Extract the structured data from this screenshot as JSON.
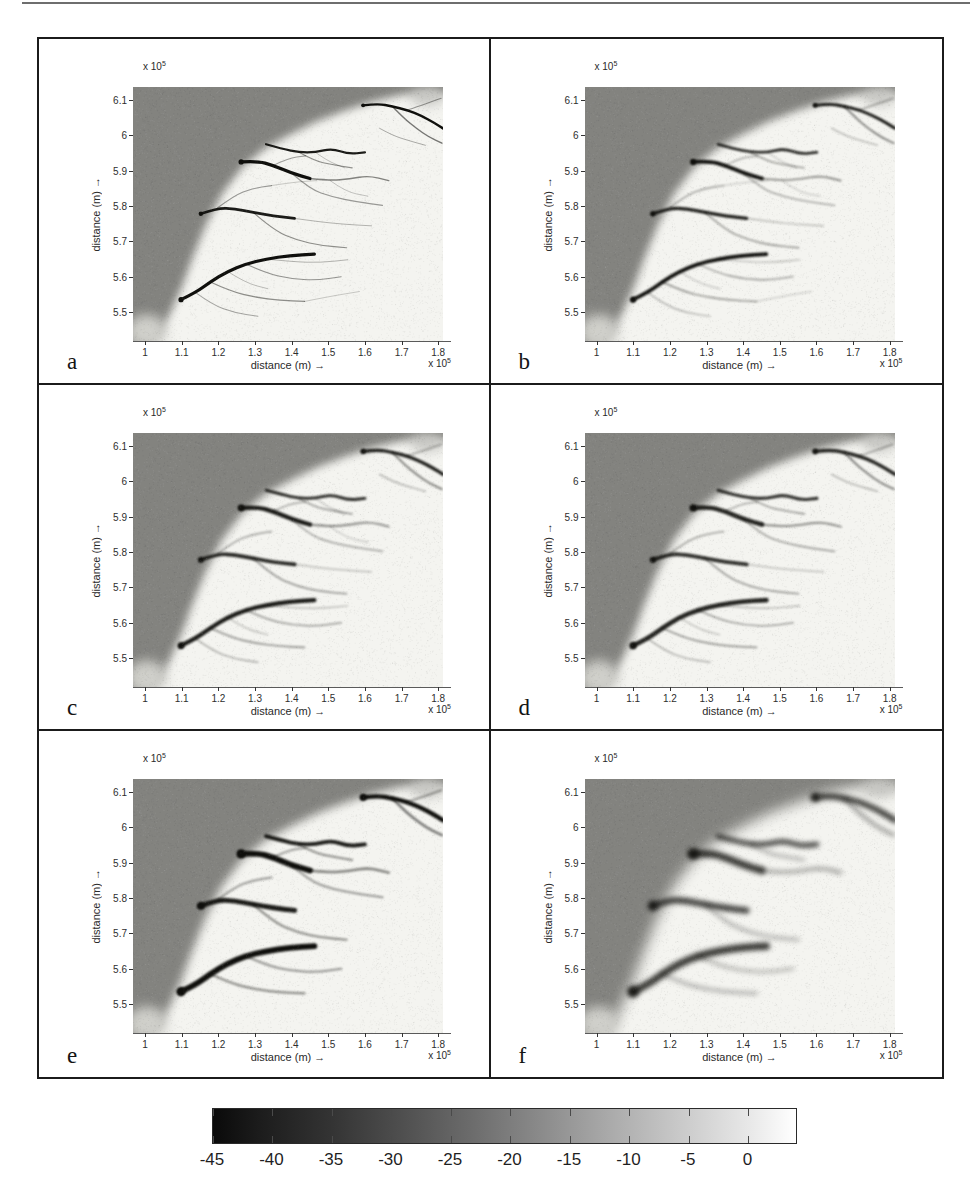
{
  "page": {
    "background": "#ffffff",
    "scan_top_line_color": "#6e6e6e"
  },
  "figure": {
    "border_color": "#1b1b1b",
    "panel_letters": [
      "a",
      "b",
      "c",
      "d",
      "e",
      "f"
    ]
  },
  "chart_data": {
    "type": "heatmap",
    "title": "",
    "grid": "3 rows x 2 columns",
    "x_axis": {
      "label": "distance (m) →",
      "exponent_base": "x 10",
      "exponent": "5",
      "tick_labels": [
        "1",
        "1.1",
        "1.2",
        "1.3",
        "1.4",
        "1.5",
        "1.6",
        "1.7",
        "1.8"
      ],
      "tick_values": [
        1,
        1.1,
        1.2,
        1.3,
        1.4,
        1.5,
        1.6,
        1.7,
        1.8
      ],
      "range": [
        0.967,
        1.813
      ]
    },
    "y_axis": {
      "label": "distance (m) →",
      "exponent_base": "x 10",
      "exponent": "5",
      "tick_labels": [
        "5.5",
        "5.6",
        "5.7",
        "5.8",
        "5.9",
        "6",
        "6.1"
      ],
      "tick_values": [
        5.5,
        5.6,
        5.7,
        5.8,
        5.9,
        6,
        6.1
      ],
      "range": [
        5.418,
        6.137
      ]
    },
    "colorbar": {
      "tick_labels": [
        "-45",
        "-40",
        "-35",
        "-30",
        "-25",
        "-20",
        "-15",
        "-10",
        "-5",
        "0"
      ],
      "tick_values": [
        -45,
        -40,
        -35,
        -30,
        -25,
        -20,
        -15,
        -10,
        -5,
        0
      ],
      "value_range": [
        -45,
        4
      ],
      "colormap": "gray (dark = deep)"
    },
    "sea_color": "#83837f",
    "flat_color": "#f4f4f0",
    "shoal_color": "#cfcfca",
    "channel_color": [
      15,
      15,
      12
    ],
    "panels": [
      {
        "label": "a",
        "blur": 0.6,
        "width_scale": 0.95,
        "alpha_scale": 1.0,
        "min_intensity": 0,
        "sea_blur": 4
      },
      {
        "label": "b",
        "blur": 0.8,
        "width_scale": 1.1,
        "alpha_scale": 1.0,
        "min_intensity": 0.22,
        "sea_blur": 4
      },
      {
        "label": "c",
        "blur": 0.9,
        "width_scale": 1.25,
        "alpha_scale": 0.95,
        "min_intensity": 0.26,
        "sea_blur": 4
      },
      {
        "label": "d",
        "blur": 1.3,
        "width_scale": 1.35,
        "alpha_scale": 0.9,
        "min_intensity": 0.3,
        "sea_blur": 4
      },
      {
        "label": "e",
        "blur": 1.0,
        "width_scale": 1.7,
        "alpha_scale": 1.0,
        "min_intensity": 0.38,
        "sea_blur": 5
      },
      {
        "label": "f",
        "blur": 2.4,
        "width_scale": 2.1,
        "alpha_scale": 0.85,
        "min_intensity": 0.42,
        "sea_blur": 7
      }
    ],
    "sea_boundary": [
      [
        0.9,
        5.39
      ],
      [
        0.967,
        5.395
      ],
      [
        1.005,
        5.405
      ],
      [
        1.04,
        5.44
      ],
      [
        1.07,
        5.5
      ],
      [
        1.1,
        5.57
      ],
      [
        1.13,
        5.655
      ],
      [
        1.165,
        5.745
      ],
      [
        1.21,
        5.835
      ],
      [
        1.265,
        5.91
      ],
      [
        1.33,
        5.965
      ],
      [
        1.4,
        6.005
      ],
      [
        1.47,
        6.04
      ],
      [
        1.545,
        6.07
      ],
      [
        1.62,
        6.095
      ],
      [
        1.7,
        6.115
      ],
      [
        1.78,
        6.12
      ],
      [
        1.813,
        6.115
      ],
      [
        1.9,
        6.12
      ],
      [
        1.9,
        6.25
      ],
      [
        0.9,
        6.25
      ]
    ],
    "channels": [
      {
        "pts": [
          [
            1.595,
            6.085
          ],
          [
            1.635,
            6.09
          ],
          [
            1.675,
            6.082
          ],
          [
            1.715,
            6.072
          ],
          [
            1.755,
            6.055
          ],
          [
            1.79,
            6.035
          ],
          [
            1.813,
            6.02
          ]
        ],
        "w": 2.6,
        "k": 1.0
      },
      {
        "pts": [
          [
            1.675,
            6.082
          ],
          [
            1.705,
            6.05
          ],
          [
            1.74,
            6.02
          ],
          [
            1.775,
            5.995
          ],
          [
            1.81,
            5.978
          ]
        ],
        "w": 1.5,
        "k": 0.55
      },
      {
        "pts": [
          [
            1.715,
            6.072
          ],
          [
            1.745,
            6.082
          ],
          [
            1.78,
            6.095
          ],
          [
            1.808,
            6.105
          ]
        ],
        "w": 1.1,
        "k": 0.4
      },
      {
        "pts": [
          [
            1.64,
            6.02
          ],
          [
            1.675,
            6.0
          ],
          [
            1.72,
            5.985
          ],
          [
            1.765,
            5.972
          ]
        ],
        "w": 1.0,
        "k": 0.35
      },
      {
        "pts": [
          [
            1.33,
            5.975
          ],
          [
            1.375,
            5.962
          ],
          [
            1.42,
            5.952
          ],
          [
            1.465,
            5.952
          ],
          [
            1.51,
            5.963
          ],
          [
            1.555,
            5.947
          ],
          [
            1.6,
            5.952
          ]
        ],
        "w": 2.3,
        "k": 0.95
      },
      {
        "pts": [
          [
            1.42,
            5.952
          ],
          [
            1.462,
            5.928
          ],
          [
            1.51,
            5.917
          ],
          [
            1.565,
            5.908
          ]
        ],
        "w": 1.2,
        "k": 0.45
      },
      {
        "pts": [
          [
            1.262,
            5.925
          ],
          [
            1.305,
            5.928
          ],
          [
            1.35,
            5.915
          ],
          [
            1.4,
            5.893
          ],
          [
            1.45,
            5.878
          ]
        ],
        "w": 3.4,
        "k": 1.0
      },
      {
        "pts": [
          [
            1.45,
            5.878
          ],
          [
            1.505,
            5.872
          ],
          [
            1.558,
            5.877
          ],
          [
            1.61,
            5.886
          ],
          [
            1.665,
            5.872
          ]
        ],
        "w": 1.5,
        "k": 0.5
      },
      {
        "pts": [
          [
            1.4,
            5.893
          ],
          [
            1.45,
            5.848
          ],
          [
            1.51,
            5.826
          ],
          [
            1.578,
            5.812
          ],
          [
            1.648,
            5.802
          ]
        ],
        "w": 1.2,
        "k": 0.4
      },
      {
        "pts": [
          [
            1.35,
            5.915
          ],
          [
            1.39,
            5.936
          ],
          [
            1.438,
            5.942
          ]
        ],
        "w": 1.1,
        "k": 0.38
      },
      {
        "pts": [
          [
            1.152,
            5.778
          ],
          [
            1.198,
            5.795
          ],
          [
            1.245,
            5.792
          ],
          [
            1.295,
            5.782
          ],
          [
            1.35,
            5.772
          ],
          [
            1.408,
            5.765
          ]
        ],
        "w": 2.9,
        "k": 0.95
      },
      {
        "pts": [
          [
            1.198,
            5.795
          ],
          [
            1.243,
            5.83
          ],
          [
            1.292,
            5.85
          ],
          [
            1.345,
            5.858
          ]
        ],
        "w": 1.2,
        "k": 0.4
      },
      {
        "pts": [
          [
            1.295,
            5.782
          ],
          [
            1.35,
            5.732
          ],
          [
            1.415,
            5.703
          ],
          [
            1.482,
            5.688
          ],
          [
            1.55,
            5.682
          ]
        ],
        "w": 1.25,
        "k": 0.45
      },
      {
        "pts": [
          [
            1.408,
            5.765
          ],
          [
            1.478,
            5.755
          ],
          [
            1.548,
            5.748
          ],
          [
            1.618,
            5.744
          ]
        ],
        "w": 1.0,
        "k": 0.3
      },
      {
        "pts": [
          [
            1.098,
            5.535
          ],
          [
            1.138,
            5.555
          ],
          [
            1.178,
            5.585
          ],
          [
            1.225,
            5.615
          ],
          [
            1.275,
            5.636
          ],
          [
            1.33,
            5.65
          ],
          [
            1.395,
            5.66
          ],
          [
            1.462,
            5.664
          ]
        ],
        "w": 3.4,
        "k": 1.0
      },
      {
        "pts": [
          [
            1.178,
            5.585
          ],
          [
            1.235,
            5.558
          ],
          [
            1.3,
            5.542
          ],
          [
            1.368,
            5.533
          ],
          [
            1.435,
            5.53
          ]
        ],
        "w": 1.3,
        "k": 0.45
      },
      {
        "pts": [
          [
            1.275,
            5.636
          ],
          [
            1.33,
            5.61
          ],
          [
            1.398,
            5.594
          ],
          [
            1.468,
            5.59
          ],
          [
            1.535,
            5.6
          ]
        ],
        "w": 1.2,
        "k": 0.42
      },
      {
        "pts": [
          [
            1.33,
            5.65
          ],
          [
            1.405,
            5.642
          ],
          [
            1.48,
            5.64
          ],
          [
            1.553,
            5.648
          ]
        ],
        "w": 1.0,
        "k": 0.3
      },
      {
        "pts": [
          [
            1.138,
            5.555
          ],
          [
            1.185,
            5.52
          ],
          [
            1.243,
            5.498
          ],
          [
            1.308,
            5.488
          ]
        ],
        "w": 1.1,
        "k": 0.35
      },
      {
        "pts": [
          [
            1.225,
            5.615
          ],
          [
            1.275,
            5.582
          ],
          [
            1.335,
            5.566
          ]
        ],
        "w": 0.9,
        "k": 0.3
      },
      {
        "pts": [
          [
            1.465,
            5.952
          ],
          [
            1.497,
            5.928
          ],
          [
            1.545,
            5.908
          ]
        ],
        "w": 0.9,
        "k": 0.28
      },
      {
        "pts": [
          [
            1.505,
            5.872
          ],
          [
            1.548,
            5.84
          ],
          [
            1.608,
            5.828
          ]
        ],
        "w": 0.9,
        "k": 0.26
      },
      {
        "pts": [
          [
            1.345,
            5.858
          ],
          [
            1.408,
            5.868
          ],
          [
            1.468,
            5.872
          ]
        ],
        "w": 0.9,
        "k": 0.24
      },
      {
        "pts": [
          [
            1.435,
            5.53
          ],
          [
            1.508,
            5.545
          ],
          [
            1.585,
            5.558
          ]
        ],
        "w": 0.9,
        "k": 0.24
      }
    ]
  }
}
